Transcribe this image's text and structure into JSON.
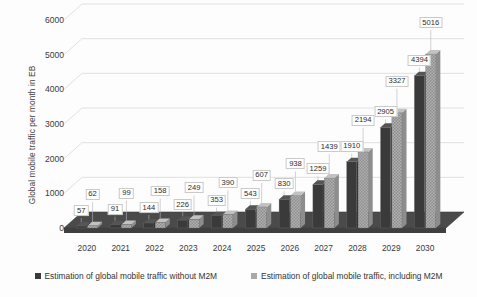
{
  "chart_data": {
    "type": "bar",
    "title": "",
    "subtitle": "",
    "xlabel": "",
    "ylabel": "Global mobile traffic per month in EB",
    "categories": [
      "2020",
      "2021",
      "2022",
      "2023",
      "2024",
      "2025",
      "2026",
      "2027",
      "2028",
      "2029",
      "2030"
    ],
    "series": [
      {
        "name": "Estimation of global mobile traffic without M2M",
        "color": "#3a3a3a",
        "values": [
          57,
          91,
          144,
          226,
          353,
          543,
          830,
          1259,
          1910,
          2905,
          4394
        ]
      },
      {
        "name": "Estimation of global mobile traffic, including M2M",
        "color": "#a9a9a9",
        "values": [
          62,
          99,
          158,
          249,
          390,
          607,
          938,
          1439,
          2194,
          3327,
          5016
        ]
      }
    ],
    "ylim": [
      0,
      6000
    ],
    "yticks": [
      "0",
      "1000",
      "2000",
      "3000",
      "4000",
      "5000",
      "6000"
    ],
    "ytick_values": [
      0,
      1000,
      2000,
      3000,
      4000,
      5000,
      6000
    ],
    "grid": true,
    "legend_position": "bottom",
    "three_d": true
  },
  "legend": {
    "items": [
      {
        "label": "Estimation of global mobile traffic without M2M",
        "color": "#3a3a3a",
        "marker": "square-marker-dark"
      },
      {
        "label": "Estimation of global mobile traffic, including M2M",
        "color": "#a9a9a9",
        "marker": "square-marker-light"
      }
    ]
  }
}
